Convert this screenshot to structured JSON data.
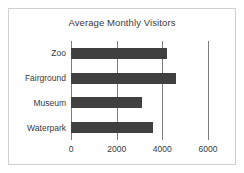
{
  "chart_data": {
    "type": "bar",
    "orientation": "horizontal",
    "title": "Average Monthly Visitors",
    "xlabel": "",
    "ylabel": "",
    "categories": [
      "Zoo",
      "Fairground",
      "Museum",
      "Waterpark"
    ],
    "values": [
      4200,
      4600,
      3100,
      3600
    ],
    "series": [
      {
        "name": "Average Monthly Visitors",
        "values": [
          4200,
          4600,
          3100,
          3600
        ]
      }
    ],
    "xlim": [
      0,
      6000
    ],
    "xticks": [
      0,
      2000,
      4000,
      6000
    ],
    "xtick_labels": [
      "0",
      "2000",
      "4000",
      "6000"
    ],
    "gridlines": [
      2000,
      4000,
      6000
    ],
    "grid": true,
    "legend": false,
    "legend_position": "none",
    "colors": {
      "bar": "#404040",
      "grid": "#7d7d7d",
      "axis": "#7d7d7d",
      "text": "#3a3a3a",
      "background": "#ffffff",
      "frame_border": "#cfcfcf"
    }
  }
}
